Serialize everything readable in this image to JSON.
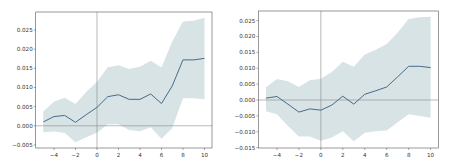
{
  "chart_data": [
    {
      "type": "line",
      "title": "",
      "xlabel": "",
      "ylabel": "",
      "x": [
        -5,
        -4,
        -3,
        -2,
        -1,
        0,
        1,
        2,
        3,
        4,
        5,
        6,
        7,
        8,
        9,
        10
      ],
      "series": [
        {
          "name": "estimate",
          "values": [
            0.001,
            0.0024,
            0.0027,
            0.0009,
            0.0029,
            0.0048,
            0.0076,
            0.0081,
            0.0069,
            0.0069,
            0.0083,
            0.0058,
            0.0104,
            0.0172,
            0.0172,
            0.0176
          ],
          "color": "#4a6a8f"
        },
        {
          "name": "ci_upper",
          "values": [
            0.0037,
            0.0063,
            0.0073,
            0.0057,
            0.0088,
            0.0115,
            0.0153,
            0.0158,
            0.0148,
            0.0154,
            0.017,
            0.0152,
            0.022,
            0.0272,
            0.0274,
            0.0282
          ]
        },
        {
          "name": "ci_lower",
          "values": [
            -0.0017,
            -0.0015,
            -0.0019,
            -0.0043,
            -0.003,
            -0.0018,
            0.0004,
            0.0004,
            -0.0011,
            -0.0014,
            -0.0004,
            -0.0034,
            -0.0006,
            0.0072,
            0.0072,
            0.0069
          ]
        }
      ],
      "band_color": "#c9dadb",
      "xlim": [
        -5.7,
        10.7
      ],
      "ylim": [
        -0.0058,
        0.0297
      ],
      "xticks": [
        -4,
        -2,
        0,
        2,
        4,
        6,
        8,
        10
      ],
      "xtick_labels": [
        "−4",
        "−2",
        "0",
        "2",
        "4",
        "6",
        "8",
        "10"
      ],
      "yticks": [
        -0.005,
        0.0,
        0.005,
        0.01,
        0.015,
        0.02,
        0.025
      ],
      "ytick_labels": [
        "−0.005",
        "0.000",
        "0.005",
        "0.010",
        "0.015",
        "0.020",
        "0.025"
      ],
      "reference_lines": {
        "vertical_x": 0,
        "horizontal_y": 0
      },
      "grid": false,
      "legend": null
    },
    {
      "type": "line",
      "title": "",
      "xlabel": "",
      "ylabel": "",
      "x": [
        -5,
        -4,
        -3,
        -2,
        -1,
        0,
        1,
        2,
        3,
        4,
        5,
        6,
        7,
        8,
        9,
        10
      ],
      "series": [
        {
          "name": "estimate",
          "values": [
            0.0006,
            0.0011,
            -0.0013,
            -0.0038,
            -0.0028,
            -0.0032,
            -0.0016,
            0.0012,
            -0.0013,
            0.0018,
            0.0029,
            0.0041,
            0.0073,
            0.0106,
            0.0106,
            0.0102
          ],
          "color": "#4a6a8f"
        },
        {
          "name": "ci_upper",
          "values": [
            0.004,
            0.0066,
            0.0059,
            0.0041,
            0.0062,
            0.0067,
            0.0088,
            0.012,
            0.0105,
            0.0143,
            0.0158,
            0.0176,
            0.0212,
            0.0255,
            0.026,
            0.0262
          ]
        },
        {
          "name": "ci_lower",
          "values": [
            -0.0035,
            -0.0045,
            -0.0082,
            -0.0115,
            -0.0115,
            -0.0128,
            -0.0118,
            -0.0098,
            -0.013,
            -0.0103,
            -0.0098,
            -0.0096,
            -0.007,
            -0.0045,
            -0.005,
            -0.0056
          ]
        }
      ],
      "band_color": "#c9dadb",
      "xlim": [
        -5.7,
        10.7
      ],
      "ylim": [
        -0.0151,
        0.028
      ],
      "xticks": [
        -4,
        -2,
        0,
        2,
        4,
        6,
        8,
        10
      ],
      "xtick_labels": [
        "−4",
        "−2",
        "0",
        "2",
        "4",
        "6",
        "8",
        "10"
      ],
      "yticks": [
        -0.015,
        -0.01,
        -0.005,
        0.0,
        0.005,
        0.01,
        0.015,
        0.02,
        0.025
      ],
      "ytick_labels": [
        "−0.015",
        "−0.010",
        "−0.005",
        "0.000",
        "0.005",
        "0.010",
        "0.015",
        "0.020",
        "0.025"
      ],
      "reference_lines": {
        "vertical_x": 0,
        "horizontal_y": 0
      },
      "grid": false,
      "legend": null
    }
  ],
  "layout": {
    "panels": [
      {
        "left": 35.7,
        "top": 12,
        "right": 212,
        "bottom": 148
      },
      {
        "left": 258.3,
        "top": 11,
        "right": 438.3,
        "bottom": 148
      }
    ]
  }
}
